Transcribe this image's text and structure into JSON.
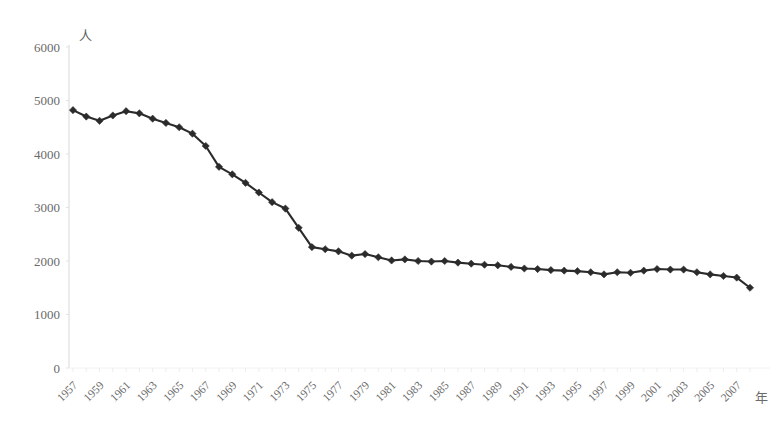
{
  "chart_data": {
    "type": "line",
    "title": "",
    "subtitle": "",
    "xlabel": "年",
    "ylabel": "人",
    "ylim": [
      0,
      6000
    ],
    "xlim": [
      1957,
      2008
    ],
    "ytick_labels": [
      "0",
      "1000",
      "2000",
      "3000",
      "4000",
      "5000",
      "6000"
    ],
    "ytick_values": [
      0,
      1000,
      2000,
      3000,
      4000,
      5000,
      6000
    ],
    "xtick_labels": [
      "1957",
      "1959",
      "1961",
      "1963",
      "1965",
      "1967",
      "1969",
      "1971",
      "1973",
      "1975",
      "1977",
      "1979",
      "1981",
      "1983",
      "1985",
      "1987",
      "1989",
      "1991",
      "1993",
      "1995",
      "1997",
      "1999",
      "2001",
      "2003",
      "2005",
      "2007"
    ],
    "xtick_values": [
      1957,
      1959,
      1961,
      1963,
      1965,
      1967,
      1969,
      1971,
      1973,
      1975,
      1977,
      1979,
      1981,
      1983,
      1985,
      1987,
      1989,
      1991,
      1993,
      1995,
      1997,
      1999,
      2001,
      2003,
      2005,
      2007
    ],
    "xtick_rotation": 45,
    "grid": false,
    "legend": false,
    "marker": "diamond",
    "line_color": "#2b2b2b",
    "marker_color": "#2b2b2b",
    "axis_color": "#e0e0e0",
    "tick_text_color": "#6a6a6a",
    "x": [
      1957,
      1958,
      1959,
      1960,
      1961,
      1962,
      1963,
      1964,
      1965,
      1966,
      1967,
      1968,
      1969,
      1970,
      1971,
      1972,
      1973,
      1974,
      1975,
      1976,
      1977,
      1978,
      1979,
      1980,
      1981,
      1982,
      1983,
      1984,
      1985,
      1986,
      1987,
      1988,
      1989,
      1990,
      1991,
      1992,
      1993,
      1994,
      1995,
      1996,
      1997,
      1998,
      1999,
      2000,
      2001,
      2002,
      2003,
      2004,
      2005,
      2006,
      2007,
      2008
    ],
    "series": [
      {
        "name": "人",
        "values": [
          4820,
          4700,
          4620,
          4720,
          4800,
          4760,
          4660,
          4580,
          4500,
          4380,
          4150,
          3760,
          3620,
          3460,
          3280,
          3100,
          2980,
          2620,
          2260,
          2220,
          2180,
          2100,
          2130,
          2070,
          2010,
          2030,
          2000,
          1990,
          2000,
          1970,
          1950,
          1930,
          1920,
          1890,
          1860,
          1850,
          1830,
          1820,
          1810,
          1790,
          1750,
          1790,
          1780,
          1820,
          1850,
          1840,
          1840,
          1790,
          1750,
          1720,
          1690,
          1500
        ]
      }
    ]
  },
  "footer": {
    "caption": ""
  }
}
